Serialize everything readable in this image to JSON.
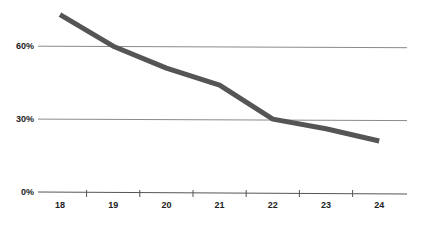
{
  "chart_data": {
    "type": "line",
    "title": "",
    "xlabel": "",
    "ylabel": "",
    "categories": [
      "18",
      "19",
      "20",
      "21",
      "22",
      "23",
      "24"
    ],
    "series": [
      {
        "name": "series-1",
        "values": [
          73,
          60,
          51,
          44,
          30,
          26,
          21
        ],
        "color": "#555555"
      }
    ],
    "yticks": [
      {
        "value": 0,
        "label": "0%"
      },
      {
        "value": 30,
        "label": "30%"
      },
      {
        "value": 60,
        "label": "60%"
      }
    ],
    "ylim": [
      0,
      75
    ],
    "grid": true,
    "legend": "none"
  },
  "style": {
    "line_color": "#555555",
    "grid_color": "#8a8a8a",
    "axis_color": "#555555"
  }
}
